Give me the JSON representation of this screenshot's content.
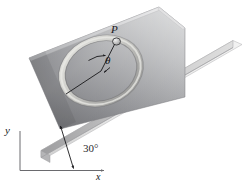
{
  "figure": {
    "labels": {
      "point_p": "P",
      "theta": "θ",
      "incline_angle": "30°",
      "axis_x": "x",
      "axis_y": "y"
    },
    "icon_names": {
      "plate": "inclined-plate-shape",
      "ring": "circular-ring-shape",
      "bead": "bead-marker-icon",
      "rail": "support-rail-shape",
      "angle_arrow": "angle-dimension-arrow-icon",
      "theta_arc": "theta-angle-arc-icon",
      "radius_line": "radius-leader-line",
      "axes": "coordinate-axes-icon"
    },
    "colors": {
      "background": "#ffffff",
      "plate_dark": "#6e6e72",
      "plate_mid": "#9a9a9e",
      "plate_light": "#d2d2d4",
      "plate_edge": "#b9b9bc",
      "ring_light": "#d8d8d6",
      "ring_shadow": "#8c8c8e",
      "rail_light": "#e3e3e3",
      "rail_mid": "#c6c6c6",
      "rail_dark": "#a4a4a6",
      "line_ink": "#17171a",
      "axis_ink": "#6a6a6e",
      "bead_fill": "#bdbdbd"
    },
    "geometry": {
      "incline_degrees": 30,
      "theta_degrees": 55
    }
  }
}
